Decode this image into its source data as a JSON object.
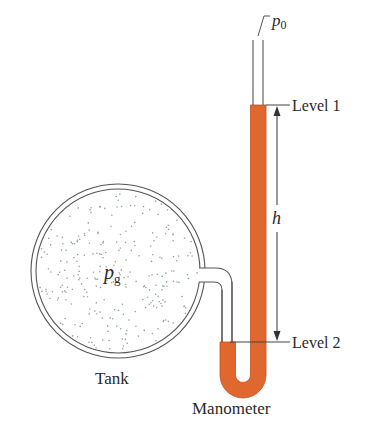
{
  "figure": {
    "labels": {
      "p0": "p",
      "p0_sub": "0",
      "level1": "Level 1",
      "level2": "Level 2",
      "h": "h",
      "pg": "p",
      "pg_sub": "g",
      "tank": "Tank",
      "manometer": "Manometer"
    },
    "colors": {
      "outline": "#555555",
      "liquid": "#e0672e",
      "liquid_edge": "#c4521f",
      "gas_dots": "#8fa69a",
      "background": "#ffffff"
    }
  }
}
